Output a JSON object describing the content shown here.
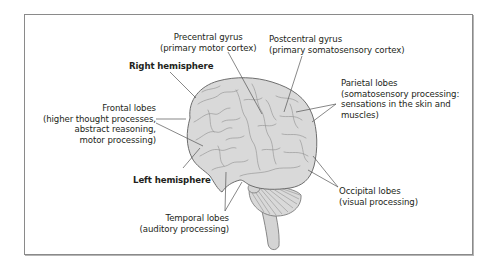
{
  "figure": {
    "type": "labeled anatomical diagram",
    "colors": {
      "frame": "#8a8a8a",
      "brain_fill": "#d9d9d9",
      "brain_stroke": "#6e6e6e",
      "leader_line": "#555555",
      "text": "#231f20"
    },
    "labels": {
      "precentral": {
        "title": "Precentral gyrus",
        "detail": "(primary motor cortex)"
      },
      "postcentral": {
        "title": "Postcentral gyrus",
        "detail": "(primary somatosensory cortex)"
      },
      "right_hemisphere": {
        "title": "Right hemisphere"
      },
      "left_hemisphere": {
        "title": "Left hemisphere"
      },
      "frontal": {
        "title": "Frontal lobes",
        "line1": "(higher thought processes,",
        "line2": "abstract reasoning,",
        "line3": "motor processing)"
      },
      "parietal": {
        "title": "Parietal lobes",
        "line1": "(somatosensory processing:",
        "line2": "sensations in the skin and",
        "line3": "muscles)"
      },
      "occipital": {
        "title": "Occipital lobes",
        "detail": "(visual processing)"
      },
      "temporal": {
        "title": "Temporal lobes",
        "detail": "(auditory processing)"
      }
    }
  }
}
